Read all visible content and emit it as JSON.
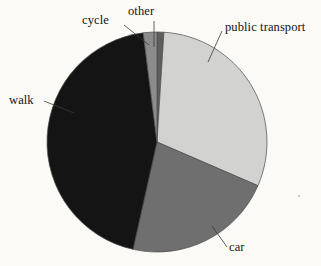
{
  "figure": {
    "background_color": "#fbfaf7",
    "width": 321,
    "height": 266
  },
  "chart_data": {
    "type": "pie",
    "title": "",
    "subtitle": "",
    "xlabel": "",
    "ylabel": "",
    "legend_position": "none",
    "labels_position": "outside-with-leader-lines",
    "grid": false,
    "center": {
      "x": 157,
      "y": 142
    },
    "radius": 110,
    "start_angle_deg": 0,
    "direction": "clockwise",
    "categories": [
      "other",
      "public transport",
      "car",
      "walk",
      "cycle"
    ],
    "values": [
      1,
      30.5,
      22,
      44.5,
      2
    ],
    "units": "percent",
    "slices": [
      {
        "label": "other",
        "value": 1,
        "percent": 1.0,
        "start_angle_deg": 0,
        "end_angle_deg": 3.6,
        "color": "#5e5e5e"
      },
      {
        "label": "public transport",
        "value": 30.5,
        "percent": 30.5,
        "start_angle_deg": 3.6,
        "end_angle_deg": 113.4,
        "color": "#d2d2d0"
      },
      {
        "label": "car",
        "value": 22,
        "percent": 22.0,
        "start_angle_deg": 113.4,
        "end_angle_deg": 192.6,
        "color": "#6f6f6f"
      },
      {
        "label": "walk",
        "value": 44.5,
        "percent": 44.5,
        "start_angle_deg": 192.6,
        "end_angle_deg": 352.8,
        "color": "#141414"
      },
      {
        "label": "cycle",
        "value": 2,
        "percent": 2.0,
        "start_angle_deg": 352.8,
        "end_angle_deg": 360,
        "color": "#8c8c8c"
      }
    ]
  },
  "labels": {
    "cycle": "cycle",
    "other": "other",
    "public_transport": "public transport",
    "walk": "walk",
    "car": "car"
  },
  "colors": {
    "walk": "#141414",
    "cycle": "#8c8c8c",
    "other": "#5e5e5e",
    "public_transport": "#d2d2d0",
    "car": "#6f6f6f",
    "outline": "#4a4a4a",
    "leader_line": "#3a3a3a",
    "text": "#131313",
    "background": "#fbfaf7"
  }
}
